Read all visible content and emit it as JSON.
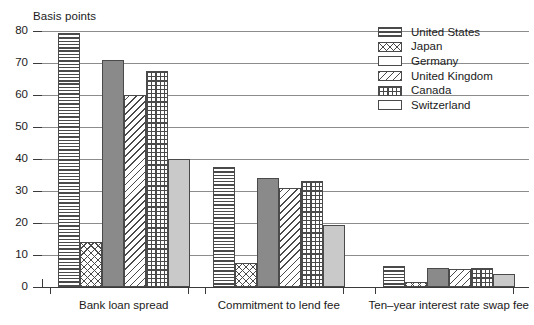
{
  "chart_data": {
    "type": "bar",
    "title": "",
    "ylabel": "Basis points",
    "xlabel": "",
    "ylim": [
      0,
      80
    ],
    "yticks": [
      0,
      10,
      20,
      30,
      40,
      50,
      60,
      70,
      80
    ],
    "grid": true,
    "legend_position": "top-right",
    "categories": [
      "Bank loan spread",
      "Commitment to lend fee",
      "Ten–year interest rate swap fee"
    ],
    "series": [
      {
        "name": "United States",
        "pattern": "horizontal-lines",
        "values": [
          79.5,
          37.5,
          6.5
        ]
      },
      {
        "name": "Japan",
        "pattern": "crosshatch",
        "values": [
          14.0,
          7.5,
          1.5
        ]
      },
      {
        "name": "Germany",
        "pattern": "solid-dark-gray",
        "values": [
          71.0,
          34.0,
          6.0
        ]
      },
      {
        "name": "United Kingdom",
        "pattern": "diagonal-lines",
        "values": [
          60.0,
          31.0,
          5.5
        ]
      },
      {
        "name": "Canada",
        "pattern": "dense-grid",
        "values": [
          67.5,
          33.0,
          6.0
        ]
      },
      {
        "name": "Switzerland",
        "pattern": "solid-light-gray",
        "values": [
          40.0,
          19.5,
          4.0
        ]
      }
    ]
  },
  "colors": {
    "grid": "#8c8c8c",
    "axis": "#3a3a3a",
    "ink": "#1b1b1b",
    "germany_fill": "#8a8a8a",
    "switzerland_fill": "#c9c9c9"
  }
}
